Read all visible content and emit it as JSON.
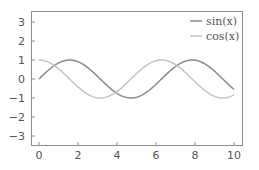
{
  "chart_data": {
    "type": "line",
    "title": "",
    "xlabel": "",
    "ylabel": "",
    "xlim": [
      -0.4,
      10.4
    ],
    "ylim": [
      -3.5,
      3.5
    ],
    "grid": false,
    "legend_position": "upper right",
    "x_ticks": [
      0,
      2,
      4,
      6,
      8,
      10
    ],
    "x_tick_labels": [
      "0",
      "2",
      "4",
      "6",
      "8",
      "10"
    ],
    "y_ticks": [
      3,
      2,
      1,
      0,
      -1,
      -2,
      -3
    ],
    "y_tick_labels": [
      "3",
      "2",
      "1",
      "0",
      "−1",
      "−2",
      "−3"
    ],
    "x": [
      0,
      0.5,
      1,
      1.5,
      2,
      2.5,
      3,
      3.5,
      4,
      4.5,
      5,
      5.5,
      6,
      6.5,
      7,
      7.5,
      8,
      8.5,
      9,
      9.5,
      10
    ],
    "series": [
      {
        "name": "sin(x)",
        "color": "#8a8a8a",
        "function": "sin",
        "values": [
          0.0,
          0.48,
          0.84,
          1.0,
          0.91,
          0.6,
          0.14,
          -0.35,
          -0.76,
          -0.98,
          -0.96,
          -0.71,
          -0.28,
          0.22,
          0.66,
          0.94,
          0.99,
          0.8,
          0.41,
          -0.08,
          -0.54
        ]
      },
      {
        "name": "cos(x)",
        "color": "#c4c4c4",
        "function": "cos",
        "values": [
          1.0,
          0.88,
          0.54,
          0.07,
          -0.42,
          -0.8,
          -0.99,
          -0.94,
          -0.65,
          -0.21,
          0.28,
          0.71,
          0.96,
          0.98,
          0.75,
          0.35,
          -0.15,
          -0.6,
          -0.91,
          -1.0,
          -0.84
        ]
      }
    ]
  },
  "legend": {
    "items": [
      {
        "label": "sin(x)",
        "color": "#8a8a8a"
      },
      {
        "label": "cos(x)",
        "color": "#c4c4c4"
      }
    ]
  },
  "style": {
    "axis_color": "#8c8c8c",
    "tick_label_color": "#555555"
  }
}
